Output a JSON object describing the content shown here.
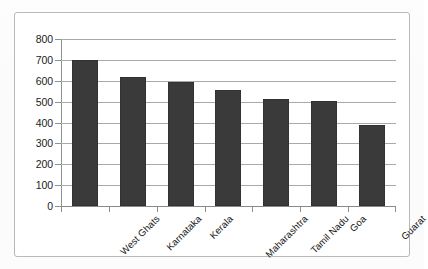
{
  "chart_data": {
    "type": "bar",
    "title": "",
    "subtitle": "",
    "xlabel": "",
    "ylabel": "",
    "categories": [
      "West Ghats",
      "Karnataka",
      "Kerala",
      "Maharashtra",
      "Tamil Nadu",
      "Goa",
      "Guarat"
    ],
    "values": [
      700,
      620,
      595,
      555,
      512,
      505,
      390
    ],
    "series": [
      {
        "name": "",
        "values": [
          700,
          620,
          595,
          555,
          512,
          505,
          390
        ]
      }
    ],
    "ylim": [
      0,
      800
    ],
    "ytick_labels": [
      "800",
      "700",
      "600",
      "500",
      "400",
      "300",
      "200",
      "100",
      "0"
    ],
    "ytick_values": [
      800,
      700,
      600,
      500,
      400,
      300,
      200,
      100,
      0
    ],
    "ytick_step": 100,
    "grid": true,
    "grid_axis": "y",
    "legend": false,
    "legend_position": "none",
    "bar_color": "#3a3a3a",
    "grid_color": "#a9a9a9",
    "axis_color": "#8f8f8f",
    "background_color": "#ffffff",
    "border_color": "#b9b9b9",
    "xlabel_rotation": -45,
    "annotations": []
  }
}
